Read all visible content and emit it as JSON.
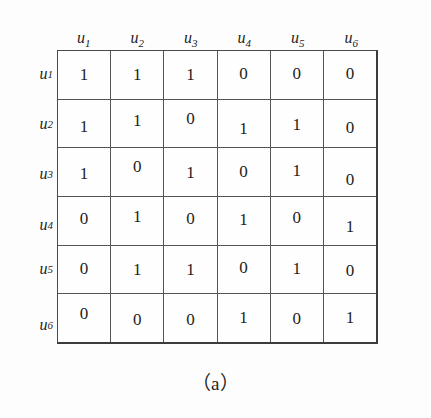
{
  "figure": {
    "caption": "（a）",
    "row_axis_labels": [
      "u",
      "u",
      "u",
      "u",
      "u",
      "u"
    ],
    "column_headers": [
      {
        "base": "u",
        "sub": "1"
      },
      {
        "base": "u",
        "sub": "2"
      },
      {
        "base": "u",
        "sub": "3"
      },
      {
        "base": "u",
        "sub": "4"
      },
      {
        "base": "u",
        "sub": "5"
      },
      {
        "base": "u",
        "sub": "6"
      }
    ],
    "row_headers": [
      {
        "base": "u",
        "sub": "1"
      },
      {
        "base": "u",
        "sub": "2"
      },
      {
        "base": "u",
        "sub": "3"
      },
      {
        "base": "u",
        "sub": "4"
      },
      {
        "base": "u",
        "sub": "5"
      },
      {
        "base": "u",
        "sub": "6"
      }
    ]
  },
  "chart_data": {
    "type": "table",
    "title": "（a）",
    "xlabel": "",
    "ylabel": "",
    "categories": [
      "u1",
      "u2",
      "u3",
      "u4",
      "u5",
      "u6"
    ],
    "row_categories": [
      "u1",
      "u2",
      "u3",
      "u4",
      "u5",
      "u6"
    ],
    "matrix": [
      [
        1,
        1,
        1,
        0,
        0,
        0
      ],
      [
        1,
        1,
        0,
        1,
        1,
        0
      ],
      [
        1,
        0,
        1,
        0,
        1,
        0
      ],
      [
        0,
        1,
        0,
        1,
        0,
        1
      ],
      [
        0,
        1,
        1,
        0,
        1,
        0
      ],
      [
        0,
        0,
        0,
        1,
        0,
        1
      ]
    ],
    "series": [
      {
        "name": "u1",
        "values": [
          1,
          1,
          1,
          0,
          0,
          0
        ]
      },
      {
        "name": "u2",
        "values": [
          1,
          1,
          0,
          1,
          1,
          0
        ]
      },
      {
        "name": "u3",
        "values": [
          1,
          0,
          1,
          0,
          1,
          0
        ]
      },
      {
        "name": "u4",
        "values": [
          0,
          1,
          0,
          1,
          0,
          1
        ]
      },
      {
        "name": "u5",
        "values": [
          0,
          1,
          1,
          0,
          1,
          0
        ]
      },
      {
        "name": "u6",
        "values": [
          0,
          0,
          0,
          1,
          0,
          1
        ]
      }
    ],
    "grid": true,
    "legend": "none"
  },
  "colors": {
    "background": "#fdfdfd",
    "grid_line": "#555555",
    "outer_border": "#3c3c3c",
    "text": "#1d1d1d"
  }
}
